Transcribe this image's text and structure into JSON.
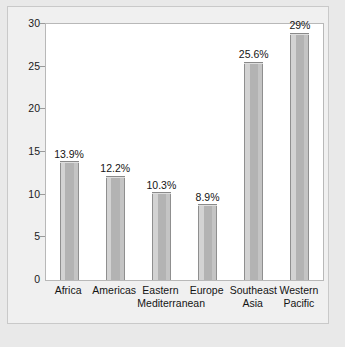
{
  "chart_data": {
    "type": "bar",
    "title": "",
    "subtitle": "",
    "xlabel": "",
    "ylabel": "",
    "categories": [
      "Africa",
      "Eastern Mediterranean",
      "Americas",
      "Europe",
      "Southeast Asia",
      "Western Pacific"
    ],
    "category_lines": [
      [
        "Africa",
        ""
      ],
      [
        "Americas",
        ""
      ],
      [
        "Eastern",
        "Mediterranean"
      ],
      [
        "Europe",
        ""
      ],
      [
        "Southeast",
        "Asia"
      ],
      [
        "Western",
        "Pacific"
      ]
    ],
    "values": [
      13.9,
      12.2,
      10.3,
      8.9,
      25.6,
      29
    ],
    "data_labels": [
      "13.9%",
      "12.2%",
      "10.3%",
      "8.9%",
      "25.6%",
      "29%"
    ],
    "ylim": [
      0,
      30
    ],
    "yticks": [
      0,
      5,
      10,
      15,
      20,
      25,
      30
    ],
    "ytick_labels": [
      "0",
      "5",
      "10",
      "15",
      "20",
      "25",
      "30"
    ],
    "grid": false,
    "legend": "none",
    "bar_style": "3d-gray",
    "colors": {
      "bar_front": "#b3b3b3",
      "bar_left": "#d3d3d3",
      "bar_right": "#c4c4c4",
      "bar_top": "#dedede",
      "bar_edge": "#8f8f8f",
      "plot_background": "#ffffff",
      "plot_border": "#b8b8b8",
      "figure_background": "#f0f0f0",
      "page_background": "#e9e9e9",
      "text": "#141414"
    }
  }
}
